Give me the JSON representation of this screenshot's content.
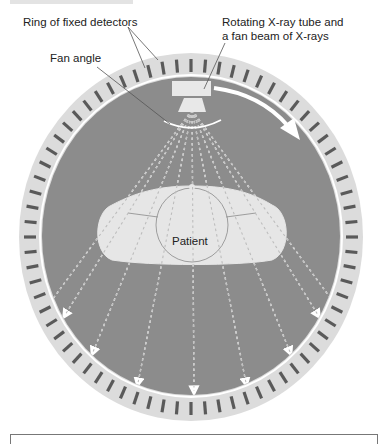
{
  "diagram": {
    "labels": {
      "detectors": "Ring of fixed detectors",
      "tube_line1": "Rotating X-ray tube and",
      "tube_line2": "a fan beam of X-rays",
      "fan_angle": "Fan angle",
      "patient": "Patient"
    },
    "components": [
      {
        "id": "detector-ring",
        "description": "outer ring of fixed detectors"
      },
      {
        "id": "xray-tube",
        "description": "rotating X-ray tube"
      },
      {
        "id": "fan-beam",
        "description": "dashed X-ray rays fanning downward"
      },
      {
        "id": "rotation-arrow",
        "description": "clockwise rotation arrow"
      },
      {
        "id": "patient",
        "description": "patient cross-section"
      }
    ],
    "colors": {
      "ring": "#dcdcdc",
      "detector": "#5a5a5a",
      "gantry_interior": "#8c8c8c",
      "patient": "#e6e6e6",
      "beam": "#ffffff"
    }
  }
}
